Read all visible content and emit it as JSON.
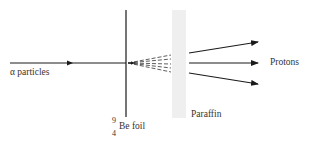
{
  "diagram": {
    "type": "experimental-setup",
    "labels": {
      "alpha": "α particles",
      "protons": "Protons",
      "paraffin": "Paraffin",
      "foil_mass_number": "9",
      "foil_atomic_number": "4",
      "foil": "Be foil"
    },
    "colors": {
      "line": "#1a1a1a",
      "paraffin": "#eeeeee",
      "background": "#ffffff"
    }
  }
}
